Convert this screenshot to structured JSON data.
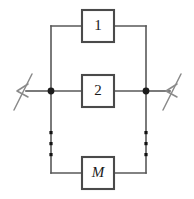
{
  "diagram": {
    "type": "circuit-schematic",
    "width": 194,
    "height": 199,
    "background_color": "#ffffff",
    "wire_color": "#595959",
    "box_border_color": "#4a4a4a",
    "node_color": "#1c1c1c",
    "break_symbol_color": "#8a8a8a",
    "branches": [
      {
        "id": "branch-1",
        "label": "1",
        "italic": false,
        "box_x": 82,
        "box_y": 10,
        "box_w": 32,
        "box_h": 32
      },
      {
        "id": "branch-2",
        "label": "2",
        "italic": false,
        "box_x": 82,
        "box_y": 75,
        "box_w": 32,
        "box_h": 32
      },
      {
        "id": "branch-m",
        "label": "M",
        "italic": true,
        "box_x": 82,
        "box_y": 157,
        "box_w": 32,
        "box_h": 32
      }
    ],
    "nodes": [
      {
        "id": "left-junction",
        "cx": 51,
        "cy": 91,
        "r": 3.4
      },
      {
        "id": "right-junction",
        "cx": 146,
        "cy": 91,
        "r": 3.4
      }
    ],
    "rails": {
      "left_x": 51,
      "right_x": 146,
      "top_y": 26,
      "bottom_y": 173,
      "main_line_y": 91
    },
    "ellipsis": {
      "label": "vertical-ellipsis",
      "count": 3,
      "left_x": 51,
      "right_x": 146,
      "start_y": 131,
      "spacing": 11,
      "dot_size": 3.2
    },
    "terminals": [
      {
        "id": "left-terminal",
        "label": "wire-break-left",
        "x": 14,
        "y": 91
      },
      {
        "id": "right-terminal",
        "label": "wire-break-right",
        "x": 180,
        "y": 91
      }
    ]
  }
}
